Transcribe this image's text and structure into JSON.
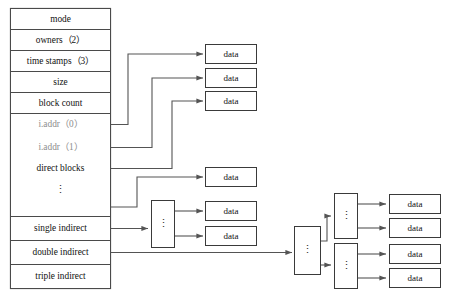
{
  "diagram": {
    "colors": {
      "stroke": "#3a3a3a",
      "connector": "#545454",
      "text": "#111111",
      "faint_text": "#8d8d8d",
      "background": "#ffffff"
    },
    "inode_table": {
      "name": "inode",
      "rows": [
        {
          "label": "mode",
          "faint": false
        },
        {
          "label": "owners（2）",
          "faint": false
        },
        {
          "label": "time stamps（3）",
          "faint": false
        },
        {
          "label": "size",
          "faint": false
        },
        {
          "label": "block count",
          "faint": false
        },
        {
          "label": "i.addr（0）",
          "faint": true
        },
        {
          "label": "i.addr（1）",
          "faint": true
        },
        {
          "label": "direct blocks",
          "faint": false
        },
        {
          "label": "⋮",
          "faint": false
        },
        {
          "label": "",
          "faint": false
        },
        {
          "label": "single indirect",
          "faint": false
        },
        {
          "label": "double indirect",
          "faint": false
        },
        {
          "label": "triple indirect",
          "faint": false
        }
      ]
    },
    "data_blocks": {
      "label": "data",
      "count": 9
    },
    "indirect_blocks": {
      "ellipsis": "⋮",
      "count": 4,
      "names": [
        "single-indirect-block",
        "double-indirect-block",
        "double-indirect-child-upper",
        "double-indirect-child-lower"
      ]
    },
    "data_block_labels": [
      "data",
      "data",
      "data",
      "data",
      "data",
      "data",
      "data",
      "data",
      "data"
    ]
  }
}
